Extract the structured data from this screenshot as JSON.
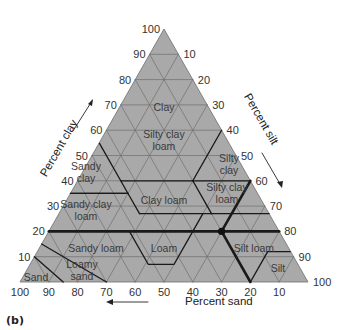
{
  "figure": {
    "panel_label": "(b)",
    "colors": {
      "fill": "#a9a9a9",
      "grid": "#6e6e6e",
      "boundary": "#1a1a1a",
      "background": "#ffffff"
    },
    "axes": {
      "clay": {
        "title": "Percent clay",
        "ticks": [
          "10",
          "20",
          "30",
          "40",
          "50",
          "60",
          "70",
          "80",
          "90",
          "100"
        ]
      },
      "silt": {
        "title": "Percent silt",
        "ticks": [
          "10",
          "20",
          "30",
          "40",
          "50",
          "60",
          "70",
          "80",
          "90",
          "100"
        ]
      },
      "sand": {
        "title": "Percent sand",
        "ticks": [
          "100",
          "90",
          "80",
          "70",
          "60",
          "50",
          "40",
          "30",
          "20",
          "10"
        ]
      }
    },
    "regions": [
      {
        "name": "Clay",
        "lines": [
          "Clay"
        ]
      },
      {
        "name": "Silty clay loam (upper)",
        "lines": [
          "Silty clay",
          "loam"
        ]
      },
      {
        "name": "Sandy clay",
        "lines": [
          "Sandy",
          "clay"
        ]
      },
      {
        "name": "Silty clay",
        "lines": [
          "Silty",
          "clay"
        ]
      },
      {
        "name": "Sandy clay loam",
        "lines": [
          "Sandy clay",
          "loam"
        ]
      },
      {
        "name": "Clay loam",
        "lines": [
          "Clay loam"
        ]
      },
      {
        "name": "Silty clay loam",
        "lines": [
          "Silty clay",
          "loam"
        ]
      },
      {
        "name": "Sandy loam",
        "lines": [
          "Sandy loam"
        ]
      },
      {
        "name": "Loam",
        "lines": [
          "Loam"
        ]
      },
      {
        "name": "Silt loam",
        "lines": [
          "Silt loam"
        ]
      },
      {
        "name": "Silt",
        "lines": [
          "Silt"
        ]
      },
      {
        "name": "Loamy sand",
        "lines": [
          "Loamy",
          "sand"
        ]
      },
      {
        "name": "Sand",
        "lines": [
          "Sand"
        ]
      }
    ],
    "highlight_point": {
      "sand": 20,
      "clay": 20,
      "silt": 60
    }
  }
}
